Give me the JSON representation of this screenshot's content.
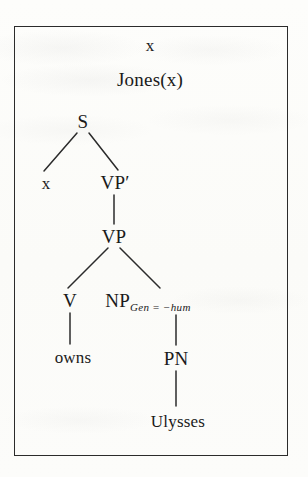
{
  "diagram": {
    "type": "syntax-tree-drs-box",
    "box": {
      "border_color": "#2b2b2b",
      "background": "#fcfcfa"
    },
    "discourse_referents": [
      {
        "id": "ref-x",
        "label": "x",
        "x": 150,
        "y": 45
      }
    ],
    "conditions": [
      {
        "id": "cond-jones",
        "label": "Jones(x)",
        "x": 150,
        "y": 79
      }
    ],
    "tree_nodes": [
      {
        "id": "node-s",
        "label": "S",
        "x": 83,
        "y": 121,
        "size": "normal"
      },
      {
        "id": "node-x-arg",
        "label": "x",
        "x": 46,
        "y": 183,
        "size": "small"
      },
      {
        "id": "node-vp-prime",
        "label": "VP′",
        "x": 115,
        "y": 182,
        "size": "normal"
      },
      {
        "id": "node-vp",
        "label": "VP",
        "x": 114,
        "y": 236,
        "size": "normal"
      },
      {
        "id": "node-v",
        "label": "V",
        "x": 70,
        "y": 300,
        "size": "normal"
      },
      {
        "id": "node-np",
        "label": "NP",
        "sublabel": "Gen = −hum",
        "x": 148,
        "y": 300,
        "size": "normal"
      },
      {
        "id": "node-owns",
        "label": "owns",
        "x": 73,
        "y": 357,
        "size": "small"
      },
      {
        "id": "node-pn",
        "label": "PN",
        "x": 176,
        "y": 358,
        "size": "normal"
      },
      {
        "id": "node-ulysses",
        "label": "Ulysses",
        "x": 178,
        "y": 421,
        "size": "small"
      }
    ],
    "edges": [
      {
        "id": "edge-s-x",
        "from": "node-s",
        "to": "node-x-arg",
        "x1": 77,
        "y1": 133,
        "x2": 44,
        "y2": 171
      },
      {
        "id": "edge-s-vpprime",
        "from": "node-s",
        "to": "node-vp-prime",
        "x1": 89,
        "y1": 133,
        "x2": 118,
        "y2": 170
      },
      {
        "id": "edge-vpprime-vp",
        "from": "node-vp-prime",
        "to": "node-vp",
        "x1": 114,
        "y1": 195,
        "x2": 114,
        "y2": 224
      },
      {
        "id": "edge-vp-v",
        "from": "node-vp",
        "to": "node-v",
        "x1": 108,
        "y1": 248,
        "x2": 68,
        "y2": 288
      },
      {
        "id": "edge-vp-np",
        "from": "node-vp",
        "to": "node-np",
        "x1": 120,
        "y1": 248,
        "x2": 160,
        "y2": 288
      },
      {
        "id": "edge-v-owns",
        "from": "node-v",
        "to": "node-owns",
        "x1": 70,
        "y1": 313,
        "x2": 70,
        "y2": 344
      },
      {
        "id": "edge-np-pn",
        "from": "node-np",
        "to": "node-pn",
        "x1": 176,
        "y1": 315,
        "x2": 176,
        "y2": 345
      },
      {
        "id": "edge-pn-ulysses",
        "from": "node-pn",
        "to": "node-ulysses",
        "x1": 176,
        "y1": 371,
        "x2": 176,
        "y2": 406
      }
    ]
  }
}
